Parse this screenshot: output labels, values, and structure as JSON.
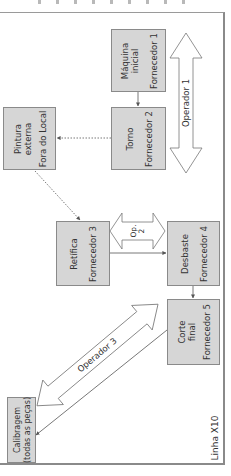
{
  "diagram": {
    "title": "Linha X10",
    "colors": {
      "box_fill": "#d6d6d6",
      "box_border": "#8a8a8a",
      "text": "#333333",
      "line": "#555555"
    },
    "boxes": [
      {
        "id": "maquina-inicial",
        "label_line1": "Máquina",
        "label_line2": "inicial",
        "supplier": "Fornecedor 1"
      },
      {
        "id": "torno",
        "label_line1": "Torno",
        "label_line2": "",
        "supplier": "Fornecedor 2"
      },
      {
        "id": "pintura-externa",
        "label_line1": "Pintura",
        "label_line2": "externa",
        "supplier": "Fora do Local"
      },
      {
        "id": "retifica",
        "label_line1": "Retífica",
        "label_line2": "",
        "supplier": "Fornecedor 3"
      },
      {
        "id": "desbaste",
        "label_line1": "Desbaste",
        "label_line2": "",
        "supplier": "Fornecedor 4"
      },
      {
        "id": "corte-final",
        "label_line1": "Corte",
        "label_line2": "final",
        "supplier": "Fornecedor 5"
      },
      {
        "id": "calibragem",
        "label_line1": "Calibragem",
        "label_line2": "(todas as peças)",
        "supplier": ""
      }
    ],
    "operators": [
      {
        "id": "operador-1",
        "label": "Operador 1"
      },
      {
        "id": "operador-2",
        "label_line1": "Op.",
        "label_line2": "2"
      },
      {
        "id": "operador-3",
        "label": "Operador 3"
      }
    ],
    "connections": [
      {
        "from": "maquina-inicial",
        "to": "torno",
        "style": "solid"
      },
      {
        "from": "torno",
        "to": "pintura-externa",
        "style": "dotted"
      },
      {
        "from": "pintura-externa",
        "to": "retifica",
        "style": "dotted"
      },
      {
        "from": "retifica",
        "to": "desbaste",
        "style": "solid"
      },
      {
        "from": "desbaste",
        "to": "corte-final",
        "style": "solid"
      },
      {
        "from": "corte-final",
        "to": "calibragem",
        "style": "solid"
      }
    ]
  }
}
